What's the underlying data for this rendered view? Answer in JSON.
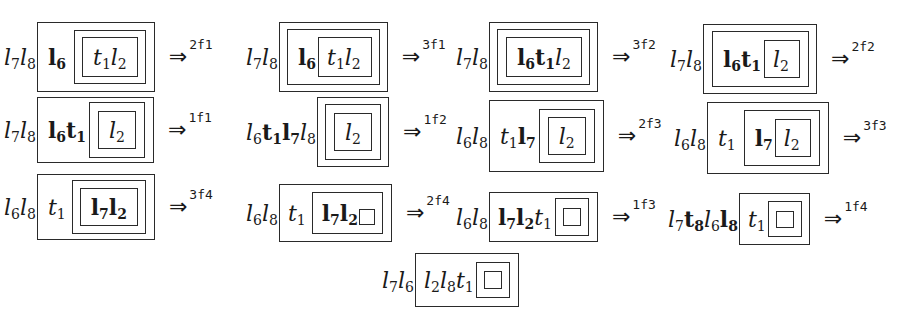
{
  "steps": [
    {
      "id": "s1",
      "x": 4,
      "y": 22,
      "height": 70,
      "prefix": [
        {
          "b": "l",
          "s": "7",
          "st": "it"
        },
        {
          "b": "l",
          "s": "8",
          "st": "it"
        }
      ],
      "box": {
        "pad": [
          0,
          8,
          0,
          10
        ],
        "h": 70,
        "items": [
          {
            "tok": {
              "b": "l",
              "s": "6",
              "st": "bf"
            }
          },
          {
            "box": {
              "pad": [
                0,
                7,
                0,
                7
              ],
              "h": 54,
              "ml": 8,
              "items": [
                {
                  "box": {
                    "pad": [
                      0,
                      10,
                      0,
                      10
                    ],
                    "h": 40,
                    "items": [
                      {
                        "tok": {
                          "b": "t",
                          "s": "1",
                          "st": "it"
                        }
                      },
                      {
                        "tok": {
                          "b": "l",
                          "s": "2",
                          "st": "it"
                        }
                      }
                    ]
                  }
                }
              ]
            }
          }
        ]
      },
      "arrow": {
        "glyph": "⇒",
        "label": "2f1"
      }
    },
    {
      "id": "s2",
      "x": 246,
      "y": 22,
      "height": 70,
      "prefix": [
        {
          "b": "l",
          "s": "7",
          "st": "it"
        },
        {
          "b": "l",
          "s": "8",
          "st": "it"
        }
      ],
      "box": {
        "pad": [
          0,
          7,
          0,
          7
        ],
        "h": 70,
        "items": [
          {
            "box": {
              "pad": [
                0,
                7,
                0,
                10
              ],
              "h": 56,
              "items": [
                {
                  "tok": {
                    "b": "l",
                    "s": "6",
                    "st": "bf"
                  }
                },
                {
                  "box": {
                    "pad": [
                      0,
                      10,
                      0,
                      8
                    ],
                    "h": 40,
                    "ml": 2,
                    "items": [
                      {
                        "tok": {
                          "b": "t",
                          "s": "1",
                          "st": "it"
                        }
                      },
                      {
                        "tok": {
                          "b": "l",
                          "s": "2",
                          "st": "it"
                        }
                      }
                    ]
                  }
                }
              ]
            }
          }
        ]
      },
      "arrow": {
        "glyph": "⇒",
        "label": "3f1"
      }
    },
    {
      "id": "s3",
      "x": 456,
      "y": 22,
      "height": 70,
      "prefix": [
        {
          "b": "l",
          "s": "7",
          "st": "it"
        },
        {
          "b": "l",
          "s": "8",
          "st": "it"
        }
      ],
      "box": {
        "pad": [
          0,
          7,
          0,
          7
        ],
        "h": 70,
        "items": [
          {
            "box": {
              "pad": [
                0,
                7,
                0,
                8
              ],
              "h": 56,
              "items": [
                {
                  "box": {
                    "pad": [
                      0,
                      10,
                      0,
                      10
                    ],
                    "h": 40,
                    "items": [
                      {
                        "tok": {
                          "b": "l",
                          "s": "6",
                          "st": "bf"
                        }
                      },
                      {
                        "tok": {
                          "b": "t",
                          "s": "1",
                          "st": "bf"
                        }
                      },
                      {
                        "tok": {
                          "b": "l",
                          "s": "2",
                          "st": "it"
                        }
                      }
                    ]
                  }
                }
              ]
            }
          }
        ]
      },
      "arrow": {
        "glyph": "⇒",
        "label": "3f2"
      }
    },
    {
      "id": "s4",
      "x": 670,
      "y": 24,
      "height": 70,
      "prefix": [
        {
          "b": "l",
          "s": "7",
          "st": "it"
        },
        {
          "b": "l",
          "s": "8",
          "st": "it"
        }
      ],
      "box": {
        "pad": [
          0,
          7,
          0,
          8
        ],
        "h": 70,
        "items": [
          {
            "box": {
              "pad": [
                0,
                8,
                0,
                10
              ],
              "h": 56,
              "items": [
                {
                  "tok": {
                    "b": "l",
                    "s": "6",
                    "st": "bf"
                  }
                },
                {
                  "tok": {
                    "b": "t",
                    "s": "1",
                    "st": "bf"
                  }
                },
                {
                  "box": {
                    "pad": [
                      0,
                      10,
                      0,
                      8
                    ],
                    "h": 38,
                    "ml": 3,
                    "items": [
                      {
                        "tok": {
                          "b": "l",
                          "s": "2",
                          "st": "it"
                        }
                      }
                    ]
                  }
                }
              ]
            }
          }
        ]
      },
      "arrow": {
        "glyph": "⇒",
        "label": "2f2"
      }
    },
    {
      "id": "s5",
      "x": 4,
      "y": 97,
      "height": 66,
      "prefix": [
        {
          "b": "l",
          "s": "7",
          "st": "it"
        },
        {
          "b": "l",
          "s": "8",
          "st": "it"
        }
      ],
      "box": {
        "pad": [
          0,
          8,
          0,
          10
        ],
        "h": 66,
        "items": [
          {
            "tok": {
              "b": "l",
              "s": "6",
              "st": "bf"
            }
          },
          {
            "tok": {
              "b": "t",
              "s": "1",
              "st": "bf"
            }
          },
          {
            "box": {
              "pad": [
                0,
                8,
                0,
                8
              ],
              "h": 56,
              "ml": 3,
              "items": [
                {
                  "box": {
                    "pad": [
                      0,
                      10,
                      0,
                      10
                    ],
                    "h": 38,
                    "items": [
                      {
                        "tok": {
                          "b": "l",
                          "s": "2",
                          "st": "it"
                        }
                      }
                    ]
                  }
                }
              ]
            }
          }
        ]
      },
      "arrow": {
        "glyph": "⇒",
        "label": "1f1"
      }
    },
    {
      "id": "s6",
      "x": 246,
      "y": 97,
      "height": 70,
      "prefix": [
        {
          "b": "l",
          "s": "6",
          "st": "it"
        },
        {
          "b": "t",
          "s": "1",
          "st": "bf"
        },
        {
          "b": "l",
          "s": "7",
          "st": "bf"
        },
        {
          "b": "l",
          "s": "8",
          "st": "it"
        }
      ],
      "box": {
        "pad": [
          0,
          7,
          0,
          7
        ],
        "h": 70,
        "items": [
          {
            "box": {
              "pad": [
                0,
                8,
                0,
                8
              ],
              "h": 56,
              "items": [
                {
                  "box": {
                    "pad": [
                      0,
                      10,
                      0,
                      10
                    ],
                    "h": 38,
                    "items": [
                      {
                        "tok": {
                          "b": "l",
                          "s": "2",
                          "st": "it"
                        }
                      }
                    ]
                  }
                }
              ]
            }
          }
        ]
      },
      "arrow": {
        "glyph": "⇒",
        "label": "1f2"
      }
    },
    {
      "id": "s7",
      "x": 456,
      "y": 100,
      "height": 72,
      "prefix": [
        {
          "b": "l",
          "s": "6",
          "st": "it"
        },
        {
          "b": "l",
          "s": "8",
          "st": "it"
        }
      ],
      "box": {
        "pad": [
          0,
          8,
          0,
          10
        ],
        "h": 72,
        "items": [
          {
            "tok": {
              "b": "t",
              "s": "1",
              "st": "it"
            }
          },
          {
            "tok": {
              "b": "l",
              "s": "7",
              "st": "bf"
            }
          },
          {
            "box": {
              "pad": [
                0,
                8,
                0,
                8
              ],
              "h": 54,
              "ml": 3,
              "items": [
                {
                  "box": {
                    "pad": [
                      0,
                      10,
                      0,
                      10
                    ],
                    "h": 38,
                    "items": [
                      {
                        "tok": {
                          "b": "l",
                          "s": "2",
                          "st": "it"
                        }
                      }
                    ]
                  }
                }
              ]
            }
          }
        ]
      },
      "arrow": {
        "glyph": "⇒",
        "label": "2f3"
      }
    },
    {
      "id": "s8",
      "x": 674,
      "y": 102,
      "height": 72,
      "prefix": [
        {
          "b": "l",
          "s": "6",
          "st": "it"
        },
        {
          "b": "l",
          "s": "8",
          "st": "it"
        }
      ],
      "box": {
        "pad": [
          0,
          8,
          0,
          10
        ],
        "h": 72,
        "items": [
          {
            "tok": {
              "b": "t",
              "s": "1",
              "st": "it"
            }
          },
          {
            "box": {
              "pad": [
                0,
                8,
                0,
                10
              ],
              "h": 56,
              "ml": 8,
              "items": [
                {
                  "tok": {
                    "b": "l",
                    "s": "7",
                    "st": "bf"
                  }
                },
                {
                  "box": {
                    "pad": [
                      0,
                      10,
                      0,
                      8
                    ],
                    "h": 38,
                    "ml": 2,
                    "items": [
                      {
                        "tok": {
                          "b": "l",
                          "s": "2",
                          "st": "it"
                        }
                      }
                    ]
                  }
                }
              ]
            }
          }
        ]
      },
      "arrow": {
        "glyph": "⇒",
        "label": "3f3"
      }
    },
    {
      "id": "s9",
      "x": 4,
      "y": 174,
      "height": 66,
      "prefix": [
        {
          "b": "l",
          "s": "6",
          "st": "it"
        },
        {
          "b": "l",
          "s": "8",
          "st": "it"
        }
      ],
      "box": {
        "pad": [
          0,
          8,
          0,
          10
        ],
        "h": 66,
        "items": [
          {
            "tok": {
              "b": "t",
              "s": "1",
              "st": "it"
            }
          },
          {
            "box": {
              "pad": [
                0,
                7,
                0,
                7
              ],
              "h": 54,
              "ml": 6,
              "items": [
                {
                  "box": {
                    "pad": [
                      0,
                      10,
                      0,
                      10
                    ],
                    "h": 38,
                    "items": [
                      {
                        "tok": {
                          "b": "l",
                          "s": "7",
                          "st": "bf"
                        }
                      },
                      {
                        "tok": {
                          "b": "l",
                          "s": "2",
                          "st": "bf"
                        }
                      }
                    ]
                  }
                }
              ]
            }
          }
        ]
      },
      "arrow": {
        "glyph": "⇒",
        "label": "3f4"
      }
    },
    {
      "id": "s10",
      "x": 246,
      "y": 184,
      "height": 58,
      "prefix": [
        {
          "b": "l",
          "s": "6",
          "st": "it"
        },
        {
          "b": "l",
          "s": "8",
          "st": "it"
        }
      ],
      "box": {
        "pad": [
          0,
          8,
          0,
          8
        ],
        "h": 58,
        "items": [
          {
            "tok": {
              "b": "t",
              "s": "1",
              "st": "it"
            }
          },
          {
            "box": {
              "pad": [
                0,
                7,
                0,
                9
              ],
              "h": 42,
              "ml": 6,
              "items": [
                {
                  "tok": {
                    "b": "l",
                    "s": "7",
                    "st": "bf"
                  }
                },
                {
                  "tok": {
                    "b": "l",
                    "s": "2",
                    "st": "bf"
                  }
                },
                {
                  "empty": {
                    "w": 16,
                    "h": 16,
                    "ml": 1,
                    "mt": 8
                  }
                }
              ]
            }
          }
        ]
      },
      "arrow": {
        "glyph": "⇒",
        "label": "2f4"
      }
    },
    {
      "id": "s11",
      "x": 456,
      "y": 192,
      "height": 50,
      "prefix": [
        {
          "b": "l",
          "s": "6",
          "st": "it"
        },
        {
          "b": "l",
          "s": "8",
          "st": "it"
        }
      ],
      "box": {
        "pad": [
          0,
          8,
          0,
          8
        ],
        "h": 50,
        "items": [
          {
            "tok": {
              "b": "l",
              "s": "7",
              "st": "bf"
            }
          },
          {
            "tok": {
              "b": "l",
              "s": "2",
              "st": "bf"
            }
          },
          {
            "tok": {
              "b": "t",
              "s": "1",
              "st": "it"
            }
          },
          {
            "box": {
              "pad": [
                0,
                7,
                0,
                7
              ],
              "h": 38,
              "ml": 3,
              "items": [
                {
                  "empty": {
                    "w": 18,
                    "h": 18
                  }
                }
              ]
            }
          }
        ]
      },
      "arrow": {
        "glyph": "⇒",
        "label": "1f3"
      }
    },
    {
      "id": "s12",
      "x": 668,
      "y": 193,
      "height": 52,
      "prefix": [
        {
          "b": "l",
          "s": "7",
          "st": "it"
        },
        {
          "b": "t",
          "s": "8",
          "st": "bf"
        },
        {
          "b": "l",
          "s": "6",
          "st": "it"
        },
        {
          "b": "l",
          "s": "8",
          "st": "bf"
        }
      ],
      "box": {
        "pad": [
          0,
          7,
          0,
          8
        ],
        "h": 52,
        "items": [
          {
            "tok": {
              "b": "t",
              "s": "1",
              "st": "it"
            }
          },
          {
            "box": {
              "pad": [
                0,
                7,
                0,
                7
              ],
              "h": 36,
              "ml": 2,
              "items": [
                {
                  "empty": {
                    "w": 18,
                    "h": 17
                  }
                }
              ]
            }
          }
        ]
      },
      "arrow": {
        "glyph": "⇒",
        "label": "1f4"
      }
    },
    {
      "id": "s13",
      "x": 382,
      "y": 253,
      "height": 54,
      "prefix": [
        {
          "b": "l",
          "s": "7",
          "st": "it"
        },
        {
          "b": "l",
          "s": "6",
          "st": "it"
        }
      ],
      "box": {
        "pad": [
          0,
          8,
          0,
          8
        ],
        "h": 54,
        "items": [
          {
            "tok": {
              "b": "l",
              "s": "2",
              "st": "it"
            }
          },
          {
            "tok": {
              "b": "l",
              "s": "8",
              "st": "it"
            }
          },
          {
            "tok": {
              "b": "t",
              "s": "1",
              "st": "it"
            }
          },
          {
            "box": {
              "pad": [
                0,
                7,
                0,
                7
              ],
              "h": 36,
              "ml": 2,
              "items": [
                {
                  "empty": {
                    "w": 18,
                    "h": 18
                  }
                }
              ]
            }
          }
        ]
      },
      "arrow": null
    }
  ]
}
